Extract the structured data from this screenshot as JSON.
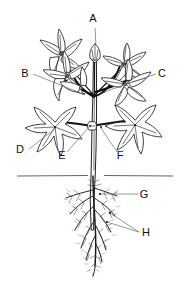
{
  "figure": {
    "kind": "botanical-diagram",
    "background_color": "#ffffff",
    "ink_color": "#1a1a1a",
    "leader_color": "#6a6a6a",
    "width": 191,
    "height": 293
  },
  "labels": [
    {
      "id": "A",
      "text": "A",
      "x": 93,
      "y": 22,
      "target_x": 96,
      "target_y": 48,
      "part": "flower"
    },
    {
      "id": "B",
      "text": "B",
      "x": 25,
      "y": 77,
      "target_x": 83,
      "target_y": 94,
      "part": "bud"
    },
    {
      "id": "C",
      "text": "C",
      "x": 162,
      "y": 77,
      "target_x": 104,
      "target_y": 92,
      "part": "branch"
    },
    {
      "id": "D",
      "text": "D",
      "x": 20,
      "y": 153,
      "target_x": 55,
      "target_y": 127,
      "part": "leaf"
    },
    {
      "id": "E",
      "text": "E",
      "x": 62,
      "y": 159,
      "target_x": 90,
      "target_y": 126,
      "part": "node"
    },
    {
      "id": "F",
      "text": "F",
      "x": 120,
      "y": 159,
      "target_x": 100,
      "target_y": 127,
      "part": "stem"
    },
    {
      "id": "G",
      "text": "G",
      "x": 144,
      "y": 198,
      "target_x": 99,
      "target_y": 194,
      "part": "taproot"
    },
    {
      "id": "H",
      "text": "H",
      "x": 146,
      "y": 236,
      "target_x": 107,
      "target_y": 222,
      "part": "lateral-roots"
    }
  ],
  "leaders": [
    {
      "id": "A",
      "points": "95,28 96,46"
    },
    {
      "id": "B",
      "points": "33,74 83,94"
    },
    {
      "id": "C",
      "points": "156,74 104,92"
    },
    {
      "id": "D",
      "points": "29,149 56,128"
    },
    {
      "id": "E",
      "points": "67,152 89,127"
    },
    {
      "id": "F",
      "points": "117,152 101,128"
    },
    {
      "id": "G",
      "points": "138,194 100,194"
    },
    {
      "id": "H1",
      "points": "139,232 110,213"
    },
    {
      "id": "H2",
      "points": "139,232 107,222"
    }
  ],
  "soil": {
    "line_y": 176,
    "x_start": 17,
    "x_end": 173
  },
  "structure": {
    "main_stem_top_y": 52,
    "main_stem_bottom_y": 186,
    "node_y": 126,
    "flower_count": 5,
    "leaf_count": 2,
    "bud_count": 1
  }
}
